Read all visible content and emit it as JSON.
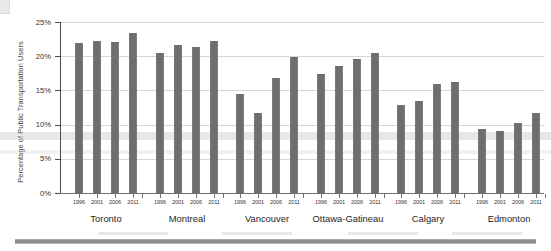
{
  "chart_data": {
    "type": "bar",
    "title": "",
    "subtitle": "",
    "xlabel": "",
    "ylabel": "Percentage of Public Transportation Users",
    "ylim": [
      0,
      25
    ],
    "ytick_labels": [
      "0%",
      "5%",
      "10%",
      "15%",
      "20%",
      "25%"
    ],
    "ytick_values": [
      0,
      5,
      10,
      15,
      20,
      25
    ],
    "grid": true,
    "legend_position": "none",
    "bar_color": "#6e6e6e",
    "categories": [
      "1996",
      "2001",
      "2006",
      "2011"
    ],
    "groups": [
      {
        "name": "Toronto",
        "categories": [
          "1996",
          "2001",
          "2006",
          "2011"
        ],
        "values": [
          21.9,
          22.2,
          22.1,
          23.4
        ]
      },
      {
        "name": "Montreal",
        "categories": [
          "1996",
          "2001",
          "2006",
          "2011"
        ],
        "values": [
          20.4,
          21.7,
          21.4,
          22.2
        ]
      },
      {
        "name": "Vancouver",
        "categories": [
          "1996",
          "2001",
          "2006",
          "2011"
        ],
        "values": [
          14.5,
          11.7,
          16.8,
          19.9
        ]
      },
      {
        "name": "Ottawa-Gatineau",
        "categories": [
          "1996",
          "2001",
          "2006",
          "2011"
        ],
        "values": [
          17.4,
          18.6,
          19.6,
          20.4
        ]
      },
      {
        "name": "Calgary",
        "categories": [
          "1996",
          "2001",
          "2006",
          "2011"
        ],
        "values": [
          12.9,
          13.5,
          15.9,
          16.2
        ]
      },
      {
        "name": "Edmonton",
        "categories": [
          "1996",
          "2001",
          "2006",
          "2011"
        ],
        "values": [
          9.4,
          9.0,
          10.2,
          11.7
        ]
      }
    ]
  }
}
